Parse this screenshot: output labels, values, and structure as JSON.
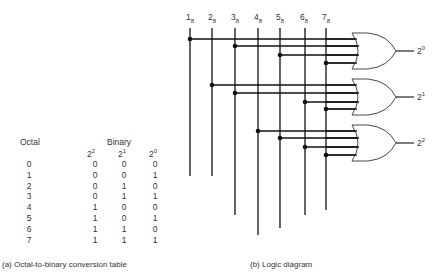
{
  "table": {
    "caption": "(a) Octal-to-binary conversion table",
    "header_octal": "Octal",
    "header_binary": "Binary",
    "bit_headers": [
      {
        "base": "2",
        "exp": "2"
      },
      {
        "base": "2",
        "exp": "1"
      },
      {
        "base": "2",
        "exp": "0"
      }
    ],
    "rows": [
      {
        "octal": "0",
        "b2": "0",
        "b1": "0",
        "b0": "0"
      },
      {
        "octal": "1",
        "b2": "0",
        "b1": "0",
        "b0": "1"
      },
      {
        "octal": "2",
        "b2": "0",
        "b1": "1",
        "b0": "0"
      },
      {
        "octal": "3",
        "b2": "0",
        "b1": "1",
        "b0": "1"
      },
      {
        "octal": "4",
        "b2": "1",
        "b1": "0",
        "b0": "0"
      },
      {
        "octal": "5",
        "b2": "1",
        "b1": "0",
        "b0": "1"
      },
      {
        "octal": "6",
        "b2": "1",
        "b1": "1",
        "b0": "0"
      },
      {
        "octal": "7",
        "b2": "1",
        "b1": "1",
        "b0": "1"
      }
    ]
  },
  "diagram": {
    "caption": "(b) Logic diagram",
    "inputs": [
      {
        "label": "1",
        "sub": "8"
      },
      {
        "label": "2",
        "sub": "8"
      },
      {
        "label": "3",
        "sub": "8"
      },
      {
        "label": "4",
        "sub": "8"
      },
      {
        "label": "5",
        "sub": "8"
      },
      {
        "label": "6",
        "sub": "8"
      },
      {
        "label": "7",
        "sub": "8"
      }
    ],
    "outputs": [
      {
        "base": "2",
        "exp": "0",
        "inputs": [
          "1",
          "3",
          "5",
          "7"
        ]
      },
      {
        "base": "2",
        "exp": "1",
        "inputs": [
          "2",
          "3",
          "6",
          "7"
        ]
      },
      {
        "base": "2",
        "exp": "2",
        "inputs": [
          "4",
          "5",
          "6",
          "7"
        ]
      }
    ],
    "gate_type": "OR"
  }
}
